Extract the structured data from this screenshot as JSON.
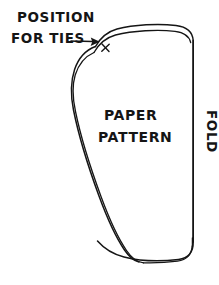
{
  "figure": {
    "kind": "hand-drawn-sewing-pattern-diagram",
    "background_color": "#ffffff",
    "ink_color": "#151515",
    "canvas": {
      "width": 219,
      "height": 285
    }
  },
  "annotations": {
    "position_for_ties": {
      "line_1": "POSITION",
      "line_2": "FOR TIES",
      "pointer_glyph": "arrow-to-x",
      "marker_glyph": "x"
    },
    "center_label": {
      "line_1": "PAPER",
      "line_2": "PATTERN"
    },
    "fold_label": {
      "text": "FOLD",
      "orientation": "rotated-90-clockwise"
    }
  },
  "shape": {
    "name": "pattern-outline",
    "description": "teardrop / shoe-sole shaped pattern piece with double seam line on the left and a straight fold edge on the right",
    "edges": [
      {
        "name": "top-edge",
        "style": "double-line-rounded"
      },
      {
        "name": "left-edge",
        "style": "double-line-curved"
      },
      {
        "name": "bottom-edge",
        "style": "double-line-curved"
      },
      {
        "name": "right-edge",
        "style": "single-straight-fold"
      }
    ]
  }
}
